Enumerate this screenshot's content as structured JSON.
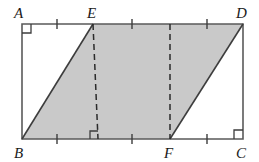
{
  "figure": {
    "kind": "geometry-diagram",
    "colors": {
      "shaded_fill": "#c9c9c9",
      "outline": "#5a5a5a",
      "diagonal_stroke": "#3d3d3d",
      "dashed_stroke": "#2b2b2b",
      "label_color": "#1a1a1a",
      "background": "#ffffff"
    },
    "vertices": [
      {
        "name": "A",
        "label": "A",
        "x": 22,
        "y": 24,
        "label_x": 14,
        "label_y": 14,
        "right_angle": true
      },
      {
        "name": "E",
        "label": "E",
        "x": 93,
        "y": 24,
        "label_x": 88,
        "label_y": 14,
        "right_angle": false
      },
      {
        "name": "D",
        "label": "D",
        "x": 243,
        "y": 24,
        "label_x": 238,
        "label_y": 14,
        "right_angle": false
      },
      {
        "name": "B",
        "label": "B",
        "x": 22,
        "y": 139,
        "label_x": 14,
        "label_y": 156,
        "right_angle": false
      },
      {
        "name": "F",
        "label": "F",
        "x": 170,
        "y": 139,
        "label_x": 165,
        "label_y": 156,
        "right_angle": false
      },
      {
        "name": "C",
        "label": "C",
        "x": 243,
        "y": 139,
        "label_x": 238,
        "label_y": 156,
        "right_angle": true
      }
    ],
    "shaded_region": {
      "name": "parallelogram-BEDF",
      "points": "22,139 93,24 243,24 170,139"
    },
    "rectangle": {
      "name": "rectangle-ABCD",
      "points": "22,24 243,24 243,139 22,139"
    },
    "diagonals": [
      {
        "name": "segment-BE",
        "x1": 22,
        "y1": 139,
        "x2": 93,
        "y2": 24
      },
      {
        "name": "segment-FD",
        "x1": 170,
        "y1": 139,
        "x2": 243,
        "y2": 24
      }
    ],
    "dashed_altitudes": [
      {
        "name": "altitude-E-to-base",
        "x1": 93,
        "y1": 24,
        "x2": 98,
        "y2": 139,
        "foot_right_angle": true
      },
      {
        "name": "altitude-top-to-F",
        "x1": 170,
        "y1": 24,
        "x2": 170,
        "y2": 139,
        "foot_right_angle": false
      }
    ],
    "tick_marks": {
      "top_edge": [
        57,
        132,
        170,
        207
      ],
      "bottom_edge": [
        57,
        132,
        207
      ]
    },
    "right_angle_markers": [
      {
        "name": "right-angle-at-A",
        "x": 22,
        "y": 24,
        "dx": 1,
        "dy": 1
      },
      {
        "name": "right-angle-at-C",
        "x": 243,
        "y": 139,
        "dx": -1,
        "dy": -1
      },
      {
        "name": "right-angle-at-altitude-foot",
        "x": 98,
        "y": 139,
        "dx": -1,
        "dy": -1
      }
    ]
  }
}
